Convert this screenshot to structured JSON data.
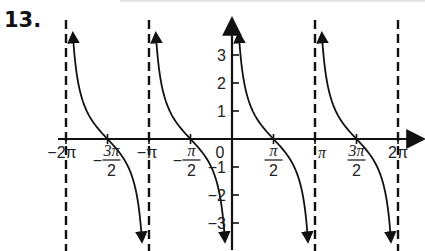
{
  "problem": {
    "number": "13."
  },
  "chart_data": {
    "type": "line",
    "title": "",
    "function": "y = cot(x)",
    "xlabel": "",
    "ylabel": "",
    "xlim": [
      -6.45,
      7.0
    ],
    "ylim": [
      -3.8,
      3.8
    ],
    "grid": false,
    "legend": null,
    "asymptotes_x": [
      "-2π",
      "-π",
      "0",
      "π",
      "2π"
    ],
    "zeros_x": [
      "-3π/2",
      "-π/2",
      "π/2",
      "3π/2"
    ],
    "x_ticks": [
      {
        "label": "−2π",
        "value": -6.2832
      },
      {
        "label": "−3π/2",
        "value": -4.7124
      },
      {
        "label": "−π",
        "value": -3.1416
      },
      {
        "label": "−π/2",
        "value": -1.5708
      },
      {
        "label": "0",
        "value": 0
      },
      {
        "label": "π/2",
        "value": 1.5708
      },
      {
        "label": "π",
        "value": 3.1416
      },
      {
        "label": "3π/2",
        "value": 4.7124
      },
      {
        "label": "2π",
        "value": 6.2832
      }
    ],
    "y_ticks": [
      -3,
      -2,
      -1,
      1,
      2,
      3
    ],
    "y_tick_labels": [
      "−3",
      "−2",
      "−1",
      "1",
      "2",
      "3"
    ],
    "branches": [
      {
        "x_from": "-2π",
        "x_to": "-π"
      },
      {
        "x_from": "-π",
        "x_to": "0"
      },
      {
        "x_from": "0",
        "x_to": "π"
      },
      {
        "x_from": "π",
        "x_to": "2π"
      }
    ]
  },
  "layout": {
    "origin_px": [
      232,
      139
    ],
    "px_per_pi": 83,
    "px_per_unit_y": 28,
    "x_axis_px": [
      58,
      422
    ],
    "y_axis_px": [
      20,
      250
    ],
    "curve_y_clip_px": [
      33,
      243
    ]
  },
  "colors": {
    "ink": "#111111",
    "background": "#ffffff"
  }
}
